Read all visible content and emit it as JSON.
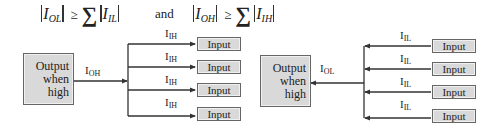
{
  "formulas": {
    "left": {
      "lhs_symbol": "I",
      "lhs_sub": "OL",
      "relation": "≥",
      "sum": "∑",
      "rhs_symbol": "I",
      "rhs_sub": "IL"
    },
    "connector": "and",
    "right": {
      "lhs_symbol": "I",
      "lhs_sub": "OH",
      "relation": "≥",
      "sum": "∑",
      "rhs_symbol": "I",
      "rhs_sub": "IH"
    }
  },
  "left_diagram": {
    "output_box": {
      "line1": "Output",
      "line2": "when",
      "line3": "high"
    },
    "output_current": {
      "symbol": "I",
      "sub": "OH"
    },
    "branches": [
      {
        "current": "I",
        "sub": "IH",
        "input_label": "Input"
      },
      {
        "current": "I",
        "sub": "IH",
        "input_label": "Input"
      },
      {
        "current": "I",
        "sub": "IH",
        "input_label": "Input"
      },
      {
        "current": "I",
        "sub": "IH",
        "input_label": "Input"
      }
    ]
  },
  "right_diagram": {
    "output_box": {
      "line1": "Output",
      "line2": "when",
      "line3": "high"
    },
    "output_current": {
      "symbol": "I",
      "sub": "OL"
    },
    "branches": [
      {
        "current": "I",
        "sub": "IL",
        "input_label": "Input"
      },
      {
        "current": "I",
        "sub": "IL",
        "input_label": "Input"
      },
      {
        "current": "I",
        "sub": "IL",
        "input_label": "Input"
      },
      {
        "current": "I",
        "sub": "IL",
        "input_label": "Input"
      }
    ]
  },
  "colors": {
    "box_fill": "#d9d9d9",
    "box_border": "#666666",
    "line": "#333333"
  }
}
